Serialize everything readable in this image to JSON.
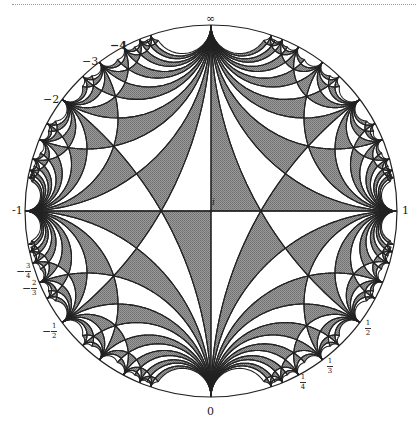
{
  "figure": {
    "disk": {
      "cx": 211,
      "cy": 211,
      "r": 186
    },
    "colors": {
      "shade": "#8c8c8c",
      "line": "#222222",
      "background": "#ffffff",
      "dotted_rule": "#9a9a9a"
    },
    "labels": {
      "infinity": "∞",
      "neg4": "−4",
      "neg3": "−3",
      "neg2": "−2",
      "neg1": "-1",
      "one": "1",
      "i": "i",
      "zero": "0",
      "neg_three_fourths": {
        "sign": "−",
        "num": "3",
        "den": "4"
      },
      "neg_two_thirds": {
        "sign": "−",
        "num": "2",
        "den": "3"
      },
      "neg_half": {
        "sign": "−",
        "num": "1",
        "den": "2"
      },
      "half": {
        "num": "1",
        "den": "2"
      },
      "third": {
        "num": "1",
        "den": "3"
      },
      "fourth": {
        "num": "1",
        "den": "4"
      }
    }
  }
}
